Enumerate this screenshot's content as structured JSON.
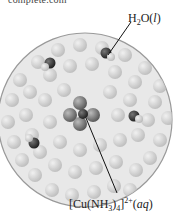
{
  "header": {
    "cropped_text": "complete.com"
  },
  "diagram": {
    "labels": {
      "water": {
        "formula": "H",
        "sub": "2",
        "rest": "O(",
        "state": "l",
        "close": ")"
      },
      "complex": {
        "open": "[Cu(NH",
        "sub": "3",
        "mid": ")",
        "sub2": "4",
        "close": "]",
        "charge": "2+",
        "state_open": "(",
        "state": "aq",
        "state_close": ")"
      }
    },
    "colors": {
      "circle_border": "#9a9a9a",
      "water_bg": "#d4d4d4",
      "molecule_dark": "#2a2a2a",
      "leader_line": "#111111"
    }
  }
}
